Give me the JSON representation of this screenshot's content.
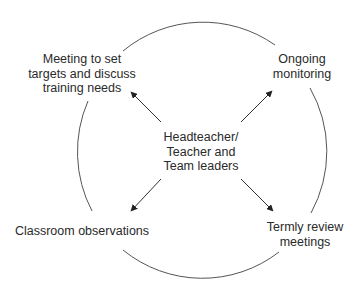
{
  "diagram": {
    "center": {
      "lines": [
        "Headteacher/",
        "Teacher and",
        "Team leaders"
      ]
    },
    "nodes": [
      {
        "id": "meeting",
        "position": "top-left",
        "lines": [
          "Meeting to set",
          "targets and discuss",
          "training needs"
        ]
      },
      {
        "id": "ongoing",
        "position": "top-right",
        "lines": [
          "Ongoing",
          "monitoring"
        ]
      },
      {
        "id": "classroom",
        "position": "bottom-left",
        "lines": [
          "Classroom observations"
        ]
      },
      {
        "id": "termly",
        "position": "bottom-right",
        "lines": [
          "Termly review",
          "meetings"
        ]
      }
    ],
    "colors": {
      "line": "#555555",
      "text": "#2a2a2a",
      "background": "#ffffff"
    }
  }
}
